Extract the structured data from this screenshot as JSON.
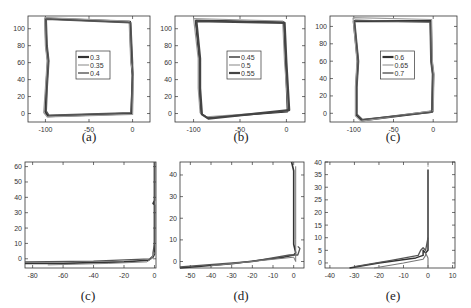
{
  "figure": {
    "captions": [
      "(a)",
      "(b)",
      "(c)",
      "(c)",
      "(d)",
      "(e)"
    ]
  },
  "chart_data": [
    {
      "id": "a",
      "type": "line",
      "caption": "(a)",
      "xlim": [
        -120,
        20
      ],
      "ylim": [
        -10,
        115
      ],
      "xticks": [
        -100,
        -50,
        0
      ],
      "yticks": [
        0,
        20,
        40,
        60,
        80,
        100
      ],
      "legend": [
        "0.3",
        "0.35",
        "0.4"
      ],
      "legend_position": "center",
      "series": [
        {
          "name": "0.3",
          "color": "#333333",
          "width": 2.2,
          "points": [
            [
              -100,
              112
            ],
            [
              -3,
              108
            ],
            [
              -1,
              60
            ],
            [
              0,
              45
            ],
            [
              -1,
              0
            ],
            [
              -97,
              -3
            ],
            [
              -100,
              2
            ],
            [
              -99,
              30
            ],
            [
              -97,
              62
            ],
            [
              -99,
              80
            ],
            [
              -100,
              112
            ]
          ]
        },
        {
          "name": "0.35",
          "color": "#9a9a9a",
          "width": 1.2,
          "points": [
            [
              -101,
              113
            ],
            [
              -4,
              109
            ],
            [
              -2,
              60
            ],
            [
              1,
              44
            ],
            [
              0,
              -1
            ],
            [
              -98,
              -4
            ],
            [
              -102,
              1
            ],
            [
              -100,
              30
            ],
            [
              -98,
              62
            ],
            [
              -100,
              80
            ],
            [
              -101,
              113
            ]
          ]
        },
        {
          "name": "0.4",
          "color": "#555555",
          "width": 1.4,
          "points": [
            [
              -99,
              111
            ],
            [
              -2,
              107
            ],
            [
              0,
              60
            ],
            [
              0,
              45
            ],
            [
              -2,
              1
            ],
            [
              -96,
              -2
            ],
            [
              -99,
              3
            ],
            [
              -98,
              30
            ],
            [
              -96,
              62
            ],
            [
              -98,
              80
            ],
            [
              -99,
              111
            ]
          ]
        }
      ]
    },
    {
      "id": "b",
      "type": "line",
      "caption": "(b)",
      "xlim": [
        -120,
        20
      ],
      "ylim": [
        -10,
        115
      ],
      "xticks": [
        -100,
        -50,
        0
      ],
      "yticks": [
        0,
        20,
        40,
        60,
        80,
        100
      ],
      "legend": [
        "0.45",
        "0.5",
        "0.55"
      ],
      "legend_position": "center",
      "series": [
        {
          "name": "0.45",
          "color": "#333333",
          "width": 1.4,
          "points": [
            [
              -98,
              110
            ],
            [
              -3,
              108
            ],
            [
              -1,
              60
            ],
            [
              1,
              2
            ],
            [
              -85,
              -5
            ],
            [
              -92,
              0
            ],
            [
              -94,
              30
            ],
            [
              -94,
              65
            ],
            [
              -98,
              110
            ]
          ]
        },
        {
          "name": "0.5",
          "color": "#9a9a9a",
          "width": 1.2,
          "points": [
            [
              -100,
              112
            ],
            [
              -4,
              109
            ],
            [
              -2,
              60
            ],
            [
              2,
              3
            ],
            [
              -86,
              -4
            ],
            [
              -93,
              1
            ],
            [
              -95,
              30
            ],
            [
              -95,
              65
            ],
            [
              -100,
              112
            ]
          ]
        },
        {
          "name": "0.55",
          "color": "#444444",
          "width": 2.2,
          "points": [
            [
              -97,
              109
            ],
            [
              -2,
              107
            ],
            [
              0,
              60
            ],
            [
              3,
              4
            ],
            [
              -84,
              -6
            ],
            [
              -91,
              -1
            ],
            [
              -93,
              30
            ],
            [
              -93,
              65
            ],
            [
              -97,
              109
            ]
          ]
        }
      ]
    },
    {
      "id": "c",
      "type": "line",
      "caption": "(c)",
      "xlim": [
        -130,
        30
      ],
      "ylim": [
        -10,
        112
      ],
      "xticks": [
        -100,
        -50,
        0
      ],
      "yticks": [
        0,
        20,
        40,
        60,
        80,
        100
      ],
      "legend": [
        "0.6",
        "0.65",
        "0.7"
      ],
      "legend_position": "center",
      "series": [
        {
          "name": "0.6",
          "color": "#333333",
          "width": 2.2,
          "points": [
            [
              -100,
              106
            ],
            [
              -3,
              106
            ],
            [
              -2,
              60
            ],
            [
              0,
              45
            ],
            [
              -1,
              2
            ],
            [
              -90,
              -8
            ],
            [
              -97,
              -2
            ],
            [
              -97,
              30
            ],
            [
              -95,
              60
            ],
            [
              -100,
              106
            ]
          ]
        },
        {
          "name": "0.65",
          "color": "#9a9a9a",
          "width": 1.2,
          "points": [
            [
              -101,
              110
            ],
            [
              -2,
              108
            ],
            [
              -1,
              60
            ],
            [
              1,
              45
            ],
            [
              0,
              3
            ],
            [
              -91,
              -9
            ],
            [
              -98,
              -3
            ],
            [
              -98,
              30
            ],
            [
              -96,
              60
            ],
            [
              -101,
              110
            ]
          ]
        },
        {
          "name": "0.7",
          "color": "#555555",
          "width": 1.4,
          "points": [
            [
              -99,
              107
            ],
            [
              -4,
              105
            ],
            [
              -3,
              60
            ],
            [
              -1,
              45
            ],
            [
              -2,
              1
            ],
            [
              -89,
              -7
            ],
            [
              -96,
              -1
            ],
            [
              -96,
              30
            ],
            [
              -94,
              60
            ],
            [
              -99,
              107
            ]
          ]
        }
      ]
    },
    {
      "id": "c2",
      "type": "line",
      "caption": "(c)",
      "xlim": [
        -85,
        1
      ],
      "ylim": [
        -6,
        63
      ],
      "xticks": [
        -80,
        -60,
        -40,
        -20,
        0
      ],
      "yticks": [
        0,
        10,
        20,
        30,
        40,
        50,
        60
      ],
      "legend": [],
      "series": [
        {
          "name": "s1",
          "color": "#333333",
          "width": 1.6,
          "points": [
            [
              -85,
              -3
            ],
            [
              -60,
              -3
            ],
            [
              -20,
              -2
            ],
            [
              -4,
              -1
            ],
            [
              -1,
              1
            ],
            [
              0,
              3
            ],
            [
              0,
              20
            ],
            [
              0,
              35
            ],
            [
              -1,
              36
            ],
            [
              0,
              38
            ],
            [
              0,
              63
            ]
          ]
        },
        {
          "name": "s2",
          "color": "#555555",
          "width": 1.3,
          "points": [
            [
              -85,
              -2
            ],
            [
              -40,
              -1.5
            ],
            [
              -3,
              0
            ],
            [
              -1,
              2
            ],
            [
              -1,
              4
            ],
            [
              0,
              10
            ],
            [
              0,
              40
            ],
            [
              0,
              63
            ]
          ]
        },
        {
          "name": "s3",
          "color": "#888888",
          "width": 1.0,
          "points": [
            [
              -70,
              -4
            ],
            [
              -30,
              -3
            ],
            [
              -5,
              -2
            ],
            [
              -2,
              0
            ],
            [
              0,
              4
            ]
          ]
        }
      ]
    },
    {
      "id": "d",
      "type": "line",
      "caption": "(d)",
      "xlim": [
        -55,
        5
      ],
      "ylim": [
        -3,
        46
      ],
      "xticks": [
        -50,
        -40,
        -30,
        -20,
        -10,
        0
      ],
      "yticks": [
        0,
        10,
        20,
        30,
        40
      ],
      "legend": [],
      "series": [
        {
          "name": "s1",
          "color": "#333333",
          "width": 1.6,
          "points": [
            [
              -55,
              -3
            ],
            [
              -30,
              -1
            ],
            [
              -5,
              2
            ],
            [
              0,
              3
            ],
            [
              1,
              4
            ],
            [
              0,
              8
            ],
            [
              0,
              30
            ],
            [
              0,
              42
            ],
            [
              -1,
              46
            ]
          ]
        },
        {
          "name": "s2",
          "color": "#555555",
          "width": 1.3,
          "points": [
            [
              -55,
              -2.5
            ],
            [
              -20,
              0
            ],
            [
              -2,
              3
            ],
            [
              2,
              3
            ],
            [
              3,
              6
            ],
            [
              2,
              7
            ]
          ]
        },
        {
          "name": "s3",
          "color": "#777777",
          "width": 1.0,
          "points": [
            [
              -40,
              -2
            ],
            [
              -10,
              1
            ],
            [
              0,
              2
            ],
            [
              1,
              0
            ],
            [
              1,
              10
            ],
            [
              1,
              44
            ]
          ]
        }
      ]
    },
    {
      "id": "e",
      "type": "line",
      "caption": "(e)",
      "xlim": [
        -42,
        11
      ],
      "ylim": [
        -2,
        40
      ],
      "xticks": [
        -40,
        -30,
        -20,
        -10,
        0,
        10
      ],
      "yticks": [
        0,
        5,
        10,
        15,
        20,
        25,
        30,
        35,
        40
      ],
      "legend": [],
      "series": [
        {
          "name": "s1",
          "color": "#333333",
          "width": 1.5,
          "points": [
            [
              -32,
              -2
            ],
            [
              -20,
              0
            ],
            [
              -5,
              2
            ],
            [
              -2,
              3
            ],
            [
              -2,
              5
            ],
            [
              -1,
              4
            ],
            [
              0,
              5
            ],
            [
              0,
              20
            ],
            [
              0,
              37
            ]
          ]
        },
        {
          "name": "s2",
          "color": "#555555",
          "width": 1.3,
          "points": [
            [
              -30,
              -1.5
            ],
            [
              -15,
              1
            ],
            [
              -4,
              3
            ],
            [
              -3,
              5
            ],
            [
              -2,
              6
            ],
            [
              -1,
              5
            ],
            [
              0,
              10
            ]
          ]
        },
        {
          "name": "s3",
          "color": "#777777",
          "width": 1.1,
          "points": [
            [
              -22,
              -2
            ],
            [
              -10,
              0
            ],
            [
              -2,
              1.5
            ],
            [
              -1,
              3
            ],
            [
              -1,
              4
            ],
            [
              0,
              2
            ],
            [
              0,
              -2
            ]
          ]
        },
        {
          "name": "s4",
          "color": "#aaaaaa",
          "width": 1.0,
          "points": [
            [
              0,
              40
            ],
            [
              0,
              38
            ]
          ]
        }
      ]
    }
  ]
}
